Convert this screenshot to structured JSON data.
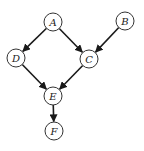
{
  "diagram": {
    "type": "directed-acyclic-graph",
    "node_radius": 9,
    "nodes": [
      {
        "id": "A",
        "label": "A",
        "x": 53,
        "y": 22
      },
      {
        "id": "B",
        "label": "B",
        "x": 125,
        "y": 21
      },
      {
        "id": "C",
        "label": "C",
        "x": 89,
        "y": 59
      },
      {
        "id": "D",
        "label": "D",
        "x": 16,
        "y": 58
      },
      {
        "id": "E",
        "label": "E",
        "x": 53,
        "y": 96
      },
      {
        "id": "F",
        "label": "F",
        "x": 54,
        "y": 131
      }
    ],
    "edges": [
      {
        "from": "A",
        "to": "D"
      },
      {
        "from": "A",
        "to": "C"
      },
      {
        "from": "B",
        "to": "C"
      },
      {
        "from": "D",
        "to": "E"
      },
      {
        "from": "C",
        "to": "E"
      },
      {
        "from": "E",
        "to": "F"
      }
    ],
    "colors": {
      "node_stroke": "#333333",
      "node_fill": "#ffffff",
      "edge": "#1a1a1a",
      "label": "#222222"
    }
  }
}
